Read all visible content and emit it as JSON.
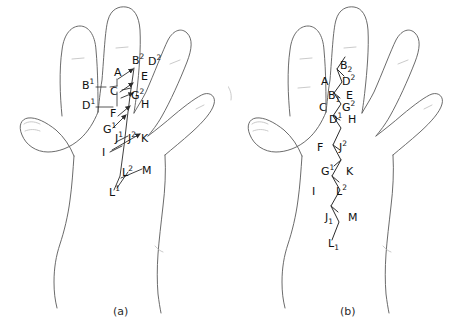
{
  "figure": {
    "type": "line-drawing-diagram",
    "background_color": "#ffffff",
    "outline_color": "#5a5a5a",
    "vein_color": "#2b2b2b",
    "label_color": "#111111"
  },
  "panels": [
    {
      "id": "a",
      "caption": "(a)",
      "description": "hand outline with vein tree and directional arrows",
      "labels": [
        {
          "id": "a-B2",
          "base": "B",
          "sup": "2",
          "sub": "",
          "x": 136,
          "y": 61
        },
        {
          "id": "a-D2",
          "base": "D",
          "sup": "2",
          "sub": "",
          "x": 152,
          "y": 62
        },
        {
          "id": "a-A",
          "base": "A",
          "sup": "",
          "sub": "",
          "x": 119,
          "y": 73
        },
        {
          "id": "a-E",
          "base": "E",
          "sup": "",
          "sub": "",
          "x": 145,
          "y": 76
        },
        {
          "id": "a-B1",
          "base": "B",
          "sup": "1",
          "sub": "",
          "x": 88,
          "y": 86
        },
        {
          "id": "a-C",
          "base": "C",
          "sup": "",
          "sub": "",
          "x": 114,
          "y": 91
        },
        {
          "id": "a-G2",
          "base": "G",
          "sup": "2",
          "sub": "",
          "x": 136,
          "y": 96
        },
        {
          "id": "a-H",
          "base": "H",
          "sup": "",
          "sub": "",
          "x": 145,
          "y": 104
        },
        {
          "id": "a-D1",
          "base": "D",
          "sup": "1",
          "sub": "",
          "x": 88,
          "y": 106
        },
        {
          "id": "a-F",
          "base": "F",
          "sup": "",
          "sub": "",
          "x": 114,
          "y": 113
        },
        {
          "id": "a-G1",
          "base": "G",
          "sup": "1",
          "sub": "",
          "x": 108,
          "y": 129
        },
        {
          "id": "a-J1",
          "base": "J",
          "sup": "1",
          "sub": "",
          "x": 119,
          "y": 138
        },
        {
          "id": "a-J2",
          "base": "J",
          "sup": "2",
          "sub": "",
          "x": 131,
          "y": 138
        },
        {
          "id": "a-K",
          "base": "K",
          "sup": "",
          "sub": "",
          "x": 143,
          "y": 138
        },
        {
          "id": "a-I",
          "base": "I",
          "sup": "",
          "sub": "",
          "x": 106,
          "y": 152
        },
        {
          "id": "a-L2",
          "base": "L",
          "sup": "2",
          "sub": "",
          "x": 126,
          "y": 172
        },
        {
          "id": "a-M",
          "base": "M",
          "sup": "",
          "sub": "",
          "x": 145,
          "y": 170
        },
        {
          "id": "a-L1",
          "base": "L",
          "sup": "1",
          "sub": "",
          "x": 113,
          "y": 192
        }
      ]
    },
    {
      "id": "b",
      "caption": "(b)",
      "description": "abstracted zig-zag graph of the same vein junction sequence",
      "labels": [
        {
          "id": "b-B2",
          "base": "B",
          "sup": "",
          "sub": "2",
          "x": 342,
          "y": 66
        },
        {
          "id": "b-A",
          "base": "A",
          "sup": "",
          "sub": "",
          "x": 323,
          "y": 82
        },
        {
          "id": "b-D2",
          "base": "D",
          "sup": "2",
          "sub": "",
          "x": 343,
          "y": 82
        },
        {
          "id": "b-B1",
          "base": "B",
          "sup": "",
          "sub": "1",
          "x": 330,
          "y": 96
        },
        {
          "id": "b-E",
          "base": "E",
          "sup": "",
          "sub": "",
          "x": 346,
          "y": 96
        },
        {
          "id": "b-C",
          "base": "C",
          "sup": "",
          "sub": "",
          "x": 321,
          "y": 108
        },
        {
          "id": "b-G2",
          "base": "G",
          "sup": "2",
          "sub": "",
          "x": 343,
          "y": 108
        },
        {
          "id": "b-D1",
          "base": "D",
          "sup": "1",
          "sub": "",
          "x": 330,
          "y": 120
        },
        {
          "id": "b-H",
          "base": "H",
          "sup": "",
          "sub": "",
          "x": 348,
          "y": 120
        },
        {
          "id": "b-F",
          "base": "F",
          "sup": "",
          "sub": "",
          "x": 318,
          "y": 148
        },
        {
          "id": "b-J2",
          "base": "J",
          "sup": "2",
          "sub": "",
          "x": 340,
          "y": 148
        },
        {
          "id": "b-G1",
          "base": "G",
          "sup": "1",
          "sub": "",
          "x": 323,
          "y": 172
        },
        {
          "id": "b-K",
          "base": "K",
          "sup": "",
          "sub": "",
          "x": 347,
          "y": 172
        },
        {
          "id": "b-I",
          "base": "I",
          "sup": "",
          "sub": "",
          "x": 312,
          "y": 192
        },
        {
          "id": "b-L2",
          "base": "L",
          "sup": "2",
          "sub": "",
          "x": 337,
          "y": 192
        },
        {
          "id": "b-J1",
          "base": "J",
          "sup": "",
          "sub": "1",
          "x": 327,
          "y": 218
        },
        {
          "id": "b-M",
          "base": "M",
          "sup": "",
          "sub": "",
          "x": 349,
          "y": 218
        },
        {
          "id": "b-L1",
          "base": "L",
          "sup": "",
          "sub": "1",
          "x": 330,
          "y": 244
        }
      ]
    }
  ]
}
